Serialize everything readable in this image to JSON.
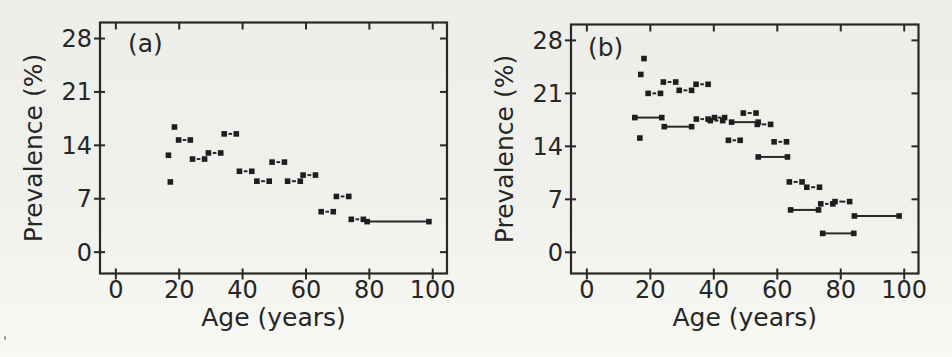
{
  "figure": {
    "ink": "#282828",
    "marker_color": "#1e1e1e",
    "background": "#f0f1ed"
  },
  "chart_data": [
    {
      "type": "scatter",
      "panel_label": "(a)",
      "xlabel": "Age (years)",
      "ylabel": "Prevalence (%)",
      "xlim": [
        -5,
        104.5
      ],
      "ylim": [
        -2.8,
        30.1
      ],
      "xticks": [
        0,
        20,
        40,
        60,
        80,
        100
      ],
      "yticks": [
        0,
        7,
        14,
        21,
        28
      ],
      "grid": false,
      "legend": null,
      "points": [
        [
          18.5,
          16.4
        ],
        [
          16.6,
          12.7
        ],
        [
          17.2,
          9.2
        ]
      ],
      "segments_dashed": [
        [
          19.8,
          23.5,
          14.7
        ],
        [
          24.2,
          28.0,
          12.2
        ],
        [
          29.2,
          33.1,
          13.0
        ],
        [
          34.2,
          38.0,
          15.5
        ],
        [
          39.0,
          42.9,
          10.6
        ],
        [
          44.5,
          48.4,
          9.3
        ],
        [
          49.3,
          53.2,
          11.8
        ],
        [
          54.2,
          58.2,
          9.3
        ],
        [
          59.1,
          63.0,
          10.1
        ],
        [
          64.8,
          68.6,
          5.3
        ],
        [
          69.6,
          73.5,
          7.3
        ],
        [
          74.3,
          78.1,
          4.3
        ]
      ],
      "segments_solid": [
        [
          79.3,
          98.8,
          4.0
        ]
      ]
    },
    {
      "type": "scatter",
      "panel_label": "(b)",
      "xlabel": "Age (years)",
      "ylabel": "Prevalence (%)",
      "xlim": [
        -5,
        104.5
      ],
      "ylim": [
        -2.8,
        30.1
      ],
      "xticks": [
        0,
        20,
        40,
        60,
        80,
        100
      ],
      "yticks": [
        0,
        7,
        14,
        21,
        28
      ],
      "grid": false,
      "legend": null,
      "points": [
        [
          18.0,
          25.6
        ],
        [
          17.0,
          23.5
        ],
        [
          16.7,
          15.1
        ]
      ],
      "segments_dashed": [
        [
          24.1,
          28.0,
          22.5
        ],
        [
          34.4,
          38.2,
          22.2
        ],
        [
          19.3,
          23.2,
          21.0
        ],
        [
          29.1,
          33.0,
          21.4
        ],
        [
          34.5,
          38.2,
          17.6
        ],
        [
          38.9,
          42.8,
          17.4
        ],
        [
          40.2,
          43.4,
          17.8
        ],
        [
          49.3,
          53.3,
          18.4
        ],
        [
          53.7,
          57.9,
          16.9
        ],
        [
          44.6,
          48.3,
          14.8
        ],
        [
          59.0,
          62.9,
          14.6
        ],
        [
          63.8,
          67.8,
          9.3
        ],
        [
          69.3,
          73.3,
          8.6
        ],
        [
          73.7,
          77.5,
          6.4
        ],
        [
          78.2,
          82.8,
          6.7
        ]
      ],
      "segments_solid": [
        [
          15.1,
          23.6,
          17.8
        ],
        [
          24.4,
          33.0,
          16.6
        ],
        [
          45.6,
          54.0,
          17.2
        ],
        [
          54.0,
          63.2,
          12.6
        ],
        [
          64.2,
          73.0,
          5.6
        ],
        [
          84.3,
          98.4,
          4.8
        ],
        [
          74.3,
          84.1,
          2.5
        ]
      ]
    }
  ]
}
